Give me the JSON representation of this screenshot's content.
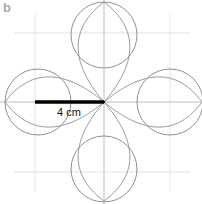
{
  "figure": {
    "panel_label": "b",
    "panel_label_color": "#a9a9a9",
    "background_color": "#ffffff",
    "width": 202,
    "height": 204,
    "dimension_label": "4 cm",
    "dimension_label_color": "#111111",
    "dimension_line_color": "#000000",
    "curve_color": "#8f8f96",
    "circle_color": "#8f8f96",
    "grid_color": "#e2e2e4",
    "axis_color": "#b8b8bc",
    "center": {
      "x": 104,
      "y": 102
    },
    "grid": {
      "vertical_x": [
        35,
        104,
        170
      ],
      "horizontal_y": [
        33,
        102,
        172
      ]
    },
    "radius_cm": 4,
    "circle_radius_px": 33,
    "circles": [
      {
        "name": "top-circle",
        "cx": 104,
        "cy": 35,
        "r": 33
      },
      {
        "name": "right-circle",
        "cx": 170,
        "cy": 102,
        "r": 33
      },
      {
        "name": "bottom-circle",
        "cx": 104,
        "cy": 169,
        "r": 33
      },
      {
        "name": "left-circle",
        "cx": 38,
        "cy": 102,
        "r": 33
      }
    ],
    "petals": [
      {
        "name": "petal-up",
        "tip_x": 104,
        "tip_y": 102,
        "far_x": 104,
        "far_y": 2
      },
      {
        "name": "petal-right",
        "tip_x": 104,
        "tip_y": 102,
        "far_x": 202,
        "far_y": 102
      },
      {
        "name": "petal-down",
        "tip_x": 104,
        "tip_y": 102,
        "far_x": 104,
        "far_y": 201
      },
      {
        "name": "petal-left",
        "tip_x": 104,
        "tip_y": 102,
        "far_x": 5,
        "far_y": 102
      }
    ],
    "dimension_line": {
      "x1": 35,
      "y1": 102,
      "x2": 104,
      "y2": 102,
      "width": 3.4
    },
    "dimension_label_pos": {
      "x": 57,
      "y": 106
    }
  }
}
